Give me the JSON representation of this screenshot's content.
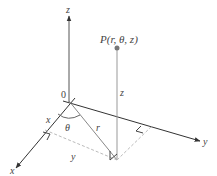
{
  "diagram": {
    "point_label": "P(r, θ, z)",
    "origin_label": "0",
    "axes": {
      "z_label": "z",
      "x_label": "x",
      "y_label": "y"
    },
    "segment_labels": {
      "height": "z",
      "radius": "r",
      "angle": "θ",
      "x_component": "x",
      "y_component": "y"
    },
    "colors": {
      "axis": "#333333",
      "vertical_line": "#999999",
      "dashed": "#bbbbbb",
      "point": "#777777",
      "text": "#444444"
    }
  }
}
